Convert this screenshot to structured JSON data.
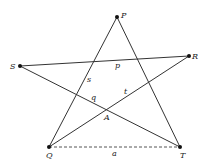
{
  "diagram": {
    "type": "pentagram",
    "points": {
      "P": {
        "label": "P",
        "x": 117,
        "y": 17
      },
      "R": {
        "label": "R",
        "x": 189,
        "y": 56
      },
      "S": {
        "label": "S",
        "x": 20,
        "y": 66
      },
      "Q": {
        "label": "Q",
        "x": 49,
        "y": 147
      },
      "T": {
        "label": "T",
        "x": 180,
        "y": 147
      }
    },
    "segment_labels": {
      "p": "p",
      "s": "s",
      "q": "q",
      "t": "t",
      "A": "A",
      "a": "a"
    },
    "edges": [
      {
        "from": "P",
        "to": "Q",
        "style": "solid"
      },
      {
        "from": "P",
        "to": "T",
        "style": "solid"
      },
      {
        "from": "S",
        "to": "R",
        "style": "solid"
      },
      {
        "from": "S",
        "to": "T",
        "style": "solid"
      },
      {
        "from": "Q",
        "to": "R",
        "style": "solid"
      },
      {
        "from": "Q",
        "to": "T",
        "style": "dashed"
      }
    ],
    "colors": {
      "line": "#333333",
      "point": "#111111"
    }
  }
}
